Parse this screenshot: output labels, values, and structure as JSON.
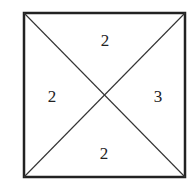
{
  "diagram": {
    "type": "square-with-diagonals",
    "square": {
      "x1": 24,
      "y1": 13,
      "x2": 185,
      "y2": 177
    },
    "stroke_color": "#222222",
    "regions": [
      {
        "position": "top",
        "value": "2",
        "x": 105,
        "y": 40
      },
      {
        "position": "left",
        "value": "2",
        "x": 52,
        "y": 96
      },
      {
        "position": "right",
        "value": "3",
        "x": 158,
        "y": 96
      },
      {
        "position": "bottom",
        "value": "2",
        "x": 104,
        "y": 153
      }
    ]
  }
}
